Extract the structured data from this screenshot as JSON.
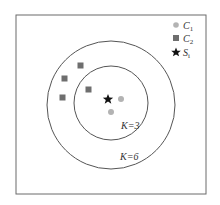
{
  "diagram": {
    "frame": {
      "x": 16,
      "y": 15,
      "width": 190,
      "height": 179,
      "stroke": "#6b6b6b"
    },
    "circles": [
      {
        "name": "K=6",
        "label": "K=6",
        "cx": 111,
        "cy": 105,
        "r": 64,
        "label_x": 120,
        "label_y": 160
      },
      {
        "name": "K=3",
        "label": "K=3",
        "cx": 111,
        "cy": 103,
        "r": 37,
        "label_x": 121,
        "label_y": 129
      }
    ],
    "points_c1": [
      {
        "x": 121,
        "y": 99
      },
      {
        "x": 111,
        "y": 112
      }
    ],
    "points_c2": [
      {
        "x": 81,
        "y": 66
      },
      {
        "x": 65,
        "y": 79
      },
      {
        "x": 89,
        "y": 90
      },
      {
        "x": 63,
        "y": 98
      }
    ],
    "point_s": {
      "x": 108,
      "y": 99
    },
    "colors": {
      "c1": "#b3b3b3",
      "c2": "#6e6e6e",
      "s": "#111111",
      "line": "#555555"
    }
  },
  "legend": {
    "items": [
      {
        "icon": "circle-icon",
        "label": "C",
        "sub": "1"
      },
      {
        "icon": "square-icon",
        "label": "C",
        "sub": "2"
      },
      {
        "icon": "star-icon",
        "label": "S",
        "sub": "i"
      }
    ]
  },
  "labels": {
    "k3": "K=3",
    "k6": "K=6"
  }
}
